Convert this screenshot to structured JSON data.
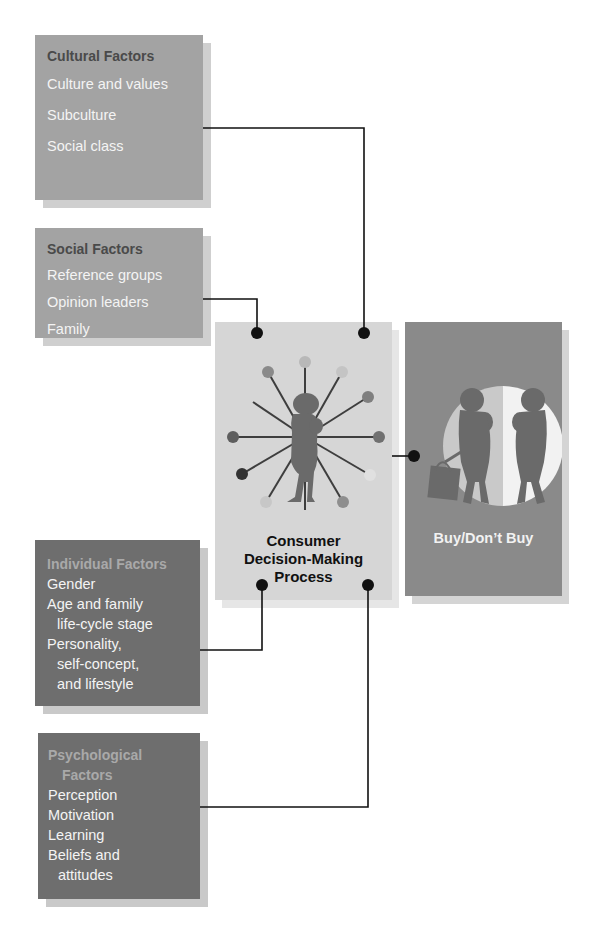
{
  "diagram": {
    "type": "flow-diagram",
    "colors": {
      "light_box": "#a3a3a3",
      "dark_box": "#6e6e6e",
      "center_box": "#d6d6d6",
      "outcome_box": "#8a8a8a",
      "connector": "#111111"
    },
    "factor_groups": [
      {
        "id": "cultural",
        "title": "Cultural Factors",
        "items": [
          "Culture and values",
          "Subculture",
          "Social class"
        ]
      },
      {
        "id": "social",
        "title": "Social Factors",
        "items": [
          "Reference groups",
          "Opinion leaders",
          "Family"
        ]
      },
      {
        "id": "individual",
        "title": "Individual Factors",
        "items": [
          "Gender",
          "Age and family",
          "life-cycle stage",
          "Personality,",
          "self-concept,",
          "and lifestyle"
        ]
      },
      {
        "id": "psychological",
        "title_line1": "Psychological",
        "title_line2": "Factors",
        "items": [
          "Perception",
          "Motivation",
          "Learning",
          "Beliefs and",
          "attitudes"
        ]
      }
    ],
    "center": {
      "label_line1": "Consumer",
      "label_line2": "Decision-Making",
      "label_line3": "Process",
      "icon": "person-with-radiating-influences-icon"
    },
    "outcome": {
      "label": "Buy/Don’t Buy",
      "icon": "two-shoppers-with-bag-icon"
    },
    "connections": [
      {
        "from": "cultural",
        "to": "center"
      },
      {
        "from": "social",
        "to": "center"
      },
      {
        "from": "individual",
        "to": "center"
      },
      {
        "from": "psychological",
        "to": "center"
      },
      {
        "from": "center",
        "to": "outcome"
      }
    ]
  }
}
